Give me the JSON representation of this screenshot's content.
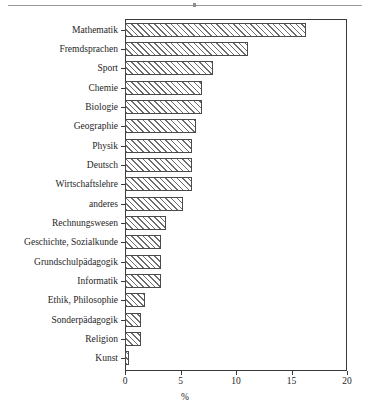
{
  "chart_data": {
    "type": "bar",
    "orientation": "horizontal",
    "title": "",
    "xlabel": "%",
    "ylabel": "",
    "xlim": [
      0,
      20
    ],
    "xticks": [
      0,
      5,
      10,
      15,
      20
    ],
    "xtick_labels": [
      "0",
      "5",
      "10",
      "15",
      "20"
    ],
    "grid": false,
    "legend": null,
    "bar_style": {
      "fill": "diagonal-hatch",
      "hatch": "///",
      "edge_color": "#4a4a4a",
      "face_color": "#ffffff",
      "hatch_color": "#6d6d6d"
    },
    "categories": [
      "Mathematik",
      "Fremdsprachen",
      "Sport",
      "Chemie",
      "Biologie",
      "Geographie",
      "Physik",
      "Deutsch",
      "Wirtschaftslehre",
      "anderes",
      "Rechnungswesen",
      "Geschichte, Sozialkunde",
      "Grundschulpädagogik",
      "Informatik",
      "Ethik, Philosophie",
      "Sonderpädagogik",
      "Religion",
      "Kunst"
    ],
    "values": [
      16.3,
      11.1,
      7.9,
      6.9,
      6.9,
      6.4,
      6.0,
      6.0,
      6.0,
      5.2,
      3.7,
      3.2,
      3.2,
      3.2,
      1.8,
      1.4,
      1.4,
      0.4
    ]
  }
}
